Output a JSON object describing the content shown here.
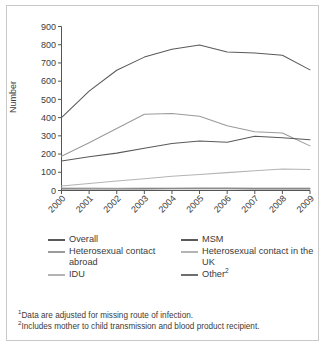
{
  "chart_data": {
    "type": "line",
    "title": "",
    "xlabel": "",
    "ylabel": "Number",
    "x": [
      "2000",
      "2001",
      "2002",
      "2003",
      "2004",
      "2005",
      "2006",
      "2007",
      "2008",
      "2009"
    ],
    "ylim": [
      0,
      900
    ],
    "ytick_values": [
      0,
      100,
      200,
      300,
      400,
      500,
      600,
      700,
      800,
      900
    ],
    "ytick_labels": [
      "0",
      "100",
      "200",
      "300",
      "400",
      "500",
      "600",
      "700",
      "800",
      "900"
    ],
    "grid": false,
    "legend_position": "below-axes",
    "series": [
      {
        "name": "Overall",
        "color": "#5a5a5a",
        "values": [
          400,
          545,
          660,
          732,
          775,
          798,
          760,
          755,
          742,
          662
        ]
      },
      {
        "name": "MSM",
        "color": "#5a5a5a",
        "values": [
          162,
          185,
          205,
          232,
          258,
          272,
          265,
          298,
          290,
          278
        ]
      },
      {
        "name": "Heterosexual contact abroad",
        "color": "#9a9a9a",
        "values": [
          188,
          262,
          340,
          418,
          422,
          408,
          355,
          322,
          315,
          245
        ]
      },
      {
        "name": "Heterosexual contact in the UK",
        "color": "#b4b4b4",
        "values": [
          25,
          38,
          52,
          65,
          78,
          88,
          98,
          108,
          118,
          115
        ]
      },
      {
        "name": "IDU",
        "color": "#b4b4b4",
        "values": [
          14,
          13,
          12,
          13,
          14,
          15,
          15,
          14,
          14,
          14
        ]
      },
      {
        "name": "Other",
        "color": "#6e6e6e",
        "values": [
          9,
          8,
          8,
          9,
          10,
          10,
          10,
          9,
          9,
          9
        ]
      }
    ]
  },
  "axes": {
    "y_title": "Number"
  },
  "legend": {
    "rows": [
      [
        {
          "label": "Overall",
          "color": "#5a5a5a",
          "name": "legend-item-overall"
        },
        {
          "label": "MSM",
          "color": "#5a5a5a",
          "name": "legend-item-msm"
        }
      ],
      [
        {
          "label": "Heterosexual contact abroad",
          "color": "#9a9a9a",
          "name": "legend-item-heterosexual-contact-abroad"
        },
        {
          "label": "Heterosexual contact in the UK",
          "color": "#b4b4b4",
          "name": "legend-item-heterosexual-contact-in-the-uk"
        }
      ],
      [
        {
          "label": "IDU",
          "color": "#b4b4b4",
          "name": "legend-item-idu"
        },
        {
          "label": "Other",
          "sup": "2",
          "color": "#6e6e6e",
          "name": "legend-item-other"
        }
      ]
    ]
  },
  "footnotes": [
    {
      "marker": "1",
      "text": "Data are adjusted for missing route of infection."
    },
    {
      "marker": "2",
      "text": "Includes mother to child transmission and blood product recipient."
    }
  ]
}
